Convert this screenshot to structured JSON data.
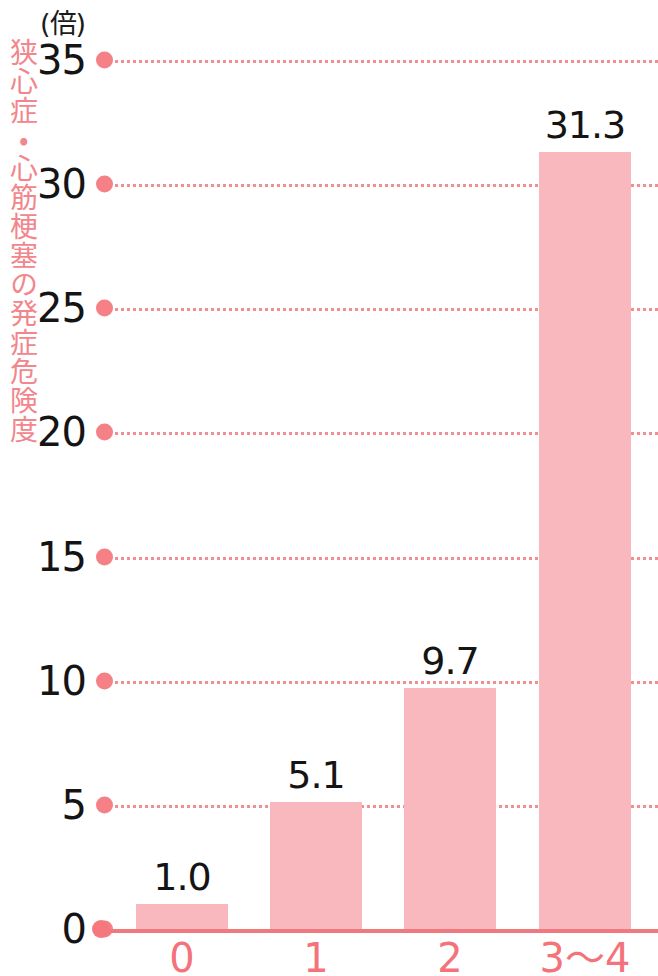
{
  "chart_data": {
    "type": "bar",
    "title": "",
    "unit_label": "(倍)",
    "ylabel": "狭心症・心筋梗塞の発症危険度",
    "xlabel": "",
    "categories": [
      "0",
      "1",
      "2",
      "3〜4"
    ],
    "values": [
      1.0,
      5.1,
      9.7,
      31.3
    ],
    "value_labels": [
      "1.0",
      "5.1",
      "9.7",
      "31.3"
    ],
    "ylim": [
      0,
      35
    ],
    "yticks": [
      0,
      5,
      10,
      15,
      20,
      25,
      30,
      35
    ],
    "ytick_labels": [
      "0",
      "5",
      "10",
      "15",
      "20",
      "25",
      "30",
      "35"
    ],
    "grid": true,
    "grid_style": "dotted",
    "legend": "none",
    "colors": {
      "bar_fill": "#f9b7be",
      "axis_line": "#f0797f",
      "grid_line": "#f08e92",
      "tick_dot": "#f58086",
      "ytick_text": "#141414",
      "xtick_text": "#f4737a",
      "ylabel_text": "#f2868c",
      "value_text": "#141414",
      "background": "#ffffff"
    }
  }
}
